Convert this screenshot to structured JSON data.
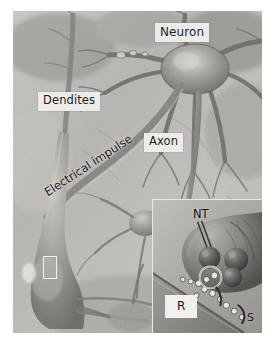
{
  "figure": {
    "kind": "scientific-illustration",
    "rendering": "grayscale pencil/airbrush drawing",
    "background_color": "#ffffff",
    "plate_color": "#b9b8b4"
  },
  "labels": {
    "neuron": "Neuron",
    "dendites": "Dendites",
    "axon": "Axon",
    "electrical_impulse": "Electrical impulse"
  },
  "inset": {
    "neurotransmitter": "NT",
    "receptor": "R",
    "synapse": "S"
  },
  "markers": {
    "zoom_box_label": ""
  },
  "palette": {
    "chip_background": "#ececea",
    "chip_text": "#1d1d1d",
    "plate_dark": "#6f6e6a",
    "plate_mid": "#9a9995",
    "plate_light": "#d2d1cd",
    "inset_background": "#a9a8a3",
    "inset_border": "#e8e8e6"
  }
}
